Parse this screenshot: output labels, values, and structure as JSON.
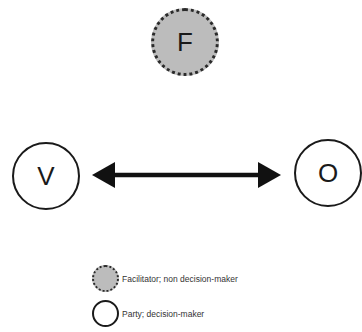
{
  "diagram": {
    "nodes": [
      {
        "id": "F",
        "label": "F",
        "type": "facilitator"
      },
      {
        "id": "V",
        "label": "V",
        "type": "party"
      },
      {
        "id": "O",
        "label": "O",
        "type": "party"
      }
    ],
    "edges": [
      {
        "from": "V",
        "to": "O",
        "style": "bidirectional-arrow"
      }
    ],
    "legend": [
      {
        "symbol": "gray-dotted-circle",
        "label": "Facilitator; non decision-maker"
      },
      {
        "symbol": "white-circle",
        "label": "Party; decision-maker"
      }
    ],
    "colors": {
      "facilitator_fill": "#bcbcbc",
      "party_fill": "#ffffff",
      "stroke": "#1a1a1a"
    }
  }
}
